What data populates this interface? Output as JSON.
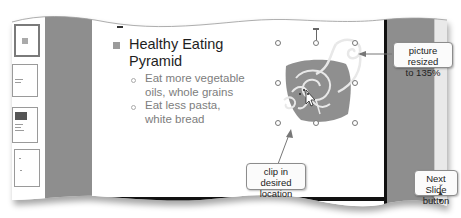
{
  "slide": {
    "bullets": [
      {
        "text_line1": "Healthy Eating",
        "text_line2": "Pyramid",
        "sub_bullets": [
          {
            "line1": "Eat more vegetable",
            "line2": "oils, whole grains"
          },
          {
            "line1": "Eat less pasta,",
            "line2": "white bread"
          }
        ]
      }
    ],
    "clip_art": "cornucopia-clip-art"
  },
  "callouts": {
    "picture_resized": {
      "line1": "picture resized",
      "line2": "to 135%"
    },
    "clip_location": {
      "line1": "clip in desired",
      "line2": "location"
    },
    "next_slide": {
      "line1": "Next Slide",
      "line2": "button"
    }
  },
  "scrollbar": {
    "up_glyph": "⌄",
    "prev_slide_glyph": "▲",
    "next_slide_glyph": "▼"
  },
  "colors": {
    "panel_gray": "#8e8e8e",
    "slide_bg": "#ffffff",
    "clip_fill": "#8f8f8f",
    "callout_border": "#8c8c8c"
  }
}
